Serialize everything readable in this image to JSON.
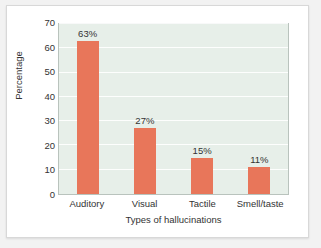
{
  "chart_data": {
    "type": "bar",
    "title": "",
    "categories": [
      "Auditory",
      "Visual",
      "Tactile",
      "Smell/taste"
    ],
    "values": [
      63,
      27,
      15,
      11
    ],
    "data_labels": [
      "63%",
      "27%",
      "15%",
      "11%"
    ],
    "xlabel": "Types of hallucinations",
    "ylabel": "Percentage",
    "ylim": [
      0,
      70
    ],
    "yticks": [
      0,
      10,
      20,
      30,
      40,
      50,
      60,
      70
    ],
    "ytick_labels": [
      "0",
      "10",
      "20",
      "30",
      "40",
      "50",
      "60",
      "70"
    ],
    "grid": true,
    "legend": "none",
    "bar_color": "#e8765a",
    "plot_background": "#e7efe9",
    "gridline_color": "#ffffff",
    "axis_color": "#b9c3bd",
    "text_color": "#333333",
    "card_background": "#ffffff",
    "page_background": "#f2f2f2"
  }
}
